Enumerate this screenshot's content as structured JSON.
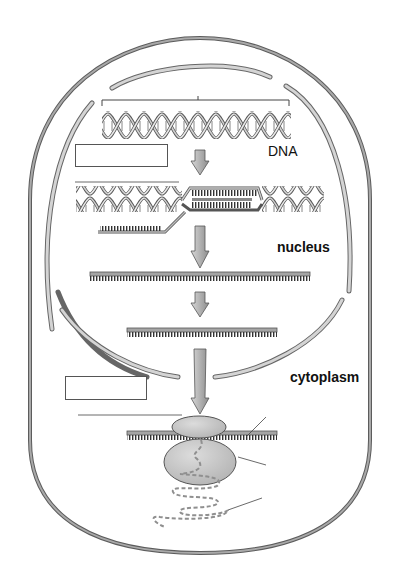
{
  "diagram": {
    "labels": {
      "dna": "DNA",
      "nucleus": "nucleus",
      "cytoplasm": "cytoplasm"
    },
    "blank_label_boxes": [
      {
        "id": "box-transcription",
        "text": ""
      },
      {
        "id": "box-translation",
        "text": ""
      }
    ],
    "stages": [
      "DNA double helix (gene bracket)",
      "Transcription (DNA unwound, RNA synthesized)",
      "Pre-mRNA",
      "Processed mRNA",
      "Translation at ribosome (polypeptide chain)"
    ],
    "colors": {
      "membrane": "#8a8a8a",
      "nuclear_envelope": "#c8c8c8",
      "strand": "#9a9a9a",
      "arrow": "#a8a8a8",
      "ribosome": "#c9c9c9",
      "polypeptide": "#8f8f8f"
    }
  }
}
